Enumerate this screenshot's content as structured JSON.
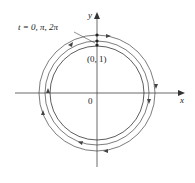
{
  "diagram": {
    "type": "parametric-curve-spiral",
    "axes": {
      "x_label": "x",
      "y_label": "y",
      "origin_label": "0"
    },
    "annotations": {
      "point_label": "(0, 1)",
      "param_label": "t = 0, π, 2π"
    },
    "curves": [
      {
        "name": "inner-circle",
        "radius_px": 47
      },
      {
        "name": "middle-circle",
        "radius_px": 52
      },
      {
        "name": "outer-circle",
        "radius_px": 58
      }
    ],
    "colors": {
      "stroke": "#333333",
      "text": "#222222"
    }
  }
}
